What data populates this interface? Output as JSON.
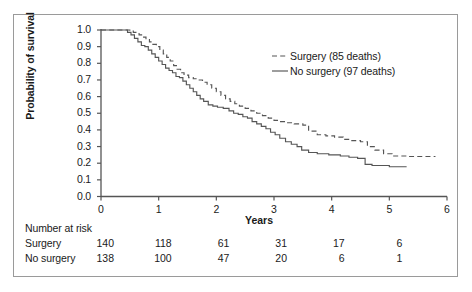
{
  "figure": {
    "background": "#ffffff",
    "frame_color": "#9a9a9a",
    "axis_color": "#555555"
  },
  "chart_data": {
    "type": "line",
    "subtype": "kaplan-meier-step",
    "title": "",
    "xlabel": "Years",
    "ylabel": "Probability of survival",
    "xlim": [
      0,
      6
    ],
    "ylim": [
      0.0,
      1.0
    ],
    "xticks": [
      "0",
      "1",
      "2",
      "3",
      "4",
      "5",
      "6"
    ],
    "yticks": [
      "0.0",
      "0.1",
      "0.2",
      "0.3",
      "0.4",
      "0.5",
      "0.6",
      "0.7",
      "0.8",
      "0.9",
      "1.0"
    ],
    "grid": false,
    "legend_position": "upper right",
    "series": [
      {
        "name": "Surgery (85 deaths)",
        "label": "Surgery",
        "deaths": 85,
        "style": "dashed",
        "color": "#555555",
        "points": [
          [
            0.0,
            1.0
          ],
          [
            0.46,
            1.0
          ],
          [
            0.5,
            0.993
          ],
          [
            0.56,
            0.986
          ],
          [
            0.62,
            0.979
          ],
          [
            0.66,
            0.971
          ],
          [
            0.72,
            0.957
          ],
          [
            0.78,
            0.943
          ],
          [
            0.84,
            0.929
          ],
          [
            0.9,
            0.914
          ],
          [
            0.96,
            0.9
          ],
          [
            1.02,
            0.879
          ],
          [
            1.08,
            0.857
          ],
          [
            1.14,
            0.836
          ],
          [
            1.2,
            0.814
          ],
          [
            1.26,
            0.786
          ],
          [
            1.32,
            0.764
          ],
          [
            1.38,
            0.743
          ],
          [
            1.44,
            0.729
          ],
          [
            1.52,
            0.714
          ],
          [
            1.6,
            0.707
          ],
          [
            1.68,
            0.7
          ],
          [
            1.76,
            0.686
          ],
          [
            1.84,
            0.671
          ],
          [
            1.92,
            0.65
          ],
          [
            2.0,
            0.629
          ],
          [
            2.08,
            0.607
          ],
          [
            2.16,
            0.586
          ],
          [
            2.24,
            0.571
          ],
          [
            2.32,
            0.557
          ],
          [
            2.4,
            0.543
          ],
          [
            2.5,
            0.529
          ],
          [
            2.6,
            0.514
          ],
          [
            2.7,
            0.5
          ],
          [
            2.8,
            0.486
          ],
          [
            2.9,
            0.471
          ],
          [
            3.0,
            0.457
          ],
          [
            3.1,
            0.45
          ],
          [
            3.2,
            0.443
          ],
          [
            3.35,
            0.436
          ],
          [
            3.5,
            0.429
          ],
          [
            3.6,
            0.393
          ],
          [
            3.75,
            0.371
          ],
          [
            3.9,
            0.364
          ],
          [
            4.05,
            0.357
          ],
          [
            4.2,
            0.343
          ],
          [
            4.35,
            0.336
          ],
          [
            4.5,
            0.329
          ],
          [
            4.62,
            0.3
          ],
          [
            4.75,
            0.279
          ],
          [
            4.9,
            0.257
          ],
          [
            5.05,
            0.243
          ],
          [
            5.3,
            0.24
          ],
          [
            5.8,
            0.24
          ]
        ]
      },
      {
        "name": "No surgery (97 deaths)",
        "label": "No surgery",
        "deaths": 97,
        "style": "solid",
        "color": "#555555",
        "points": [
          [
            0.0,
            1.0
          ],
          [
            0.4,
            1.0
          ],
          [
            0.46,
            0.986
          ],
          [
            0.52,
            0.971
          ],
          [
            0.58,
            0.95
          ],
          [
            0.64,
            0.929
          ],
          [
            0.7,
            0.907
          ],
          [
            0.76,
            0.9
          ],
          [
            0.82,
            0.879
          ],
          [
            0.88,
            0.857
          ],
          [
            0.94,
            0.836
          ],
          [
            1.0,
            0.814
          ],
          [
            1.06,
            0.793
          ],
          [
            1.12,
            0.771
          ],
          [
            1.18,
            0.757
          ],
          [
            1.24,
            0.743
          ],
          [
            1.3,
            0.721
          ],
          [
            1.36,
            0.714
          ],
          [
            1.42,
            0.693
          ],
          [
            1.48,
            0.671
          ],
          [
            1.54,
            0.65
          ],
          [
            1.6,
            0.629
          ],
          [
            1.66,
            0.607
          ],
          [
            1.72,
            0.586
          ],
          [
            1.78,
            0.571
          ],
          [
            1.86,
            0.55
          ],
          [
            1.94,
            0.543
          ],
          [
            2.02,
            0.536
          ],
          [
            2.12,
            0.529
          ],
          [
            2.22,
            0.514
          ],
          [
            2.3,
            0.5
          ],
          [
            2.38,
            0.493
          ],
          [
            2.46,
            0.479
          ],
          [
            2.54,
            0.471
          ],
          [
            2.62,
            0.45
          ],
          [
            2.7,
            0.436
          ],
          [
            2.78,
            0.421
          ],
          [
            2.86,
            0.407
          ],
          [
            2.94,
            0.386
          ],
          [
            3.02,
            0.371
          ],
          [
            3.1,
            0.35
          ],
          [
            3.2,
            0.329
          ],
          [
            3.3,
            0.314
          ],
          [
            3.4,
            0.3
          ],
          [
            3.48,
            0.279
          ],
          [
            3.6,
            0.264
          ],
          [
            3.75,
            0.257
          ],
          [
            3.95,
            0.25
          ],
          [
            4.15,
            0.243
          ],
          [
            4.3,
            0.236
          ],
          [
            4.45,
            0.229
          ],
          [
            4.58,
            0.193
          ],
          [
            4.7,
            0.186
          ],
          [
            5.0,
            0.179
          ],
          [
            5.3,
            0.179
          ]
        ]
      }
    ],
    "risk_table": {
      "title": "Number at risk",
      "times": [
        "0",
        "1",
        "2",
        "3",
        "4",
        "5"
      ],
      "rows": [
        {
          "label": "Surgery",
          "values": [
            "140",
            "118",
            "61",
            "31",
            "17",
            "6"
          ]
        },
        {
          "label": "No surgery",
          "values": [
            "138",
            "100",
            "47",
            "20",
            "6",
            "1"
          ]
        }
      ]
    }
  }
}
